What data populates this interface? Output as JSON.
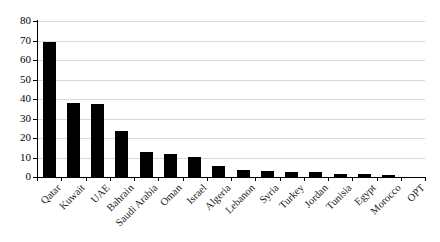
{
  "chart_data": {
    "type": "bar",
    "title": "",
    "subtitle": "",
    "xlabel": "",
    "ylabel": "",
    "ylim": [
      0,
      80
    ],
    "ytick_step": 10,
    "yticks": [
      0,
      10,
      20,
      30,
      40,
      50,
      60,
      70,
      80
    ],
    "ytick_labels": [
      "0",
      "10",
      "20",
      "30",
      "40",
      "50",
      "60",
      "70",
      "80"
    ],
    "grid": true,
    "grid_axis": "y",
    "legend": false,
    "legend_position": "none",
    "bar_color": "#000000",
    "grid_color": "#d8d8d8",
    "axis_color": "#000000",
    "background_color": "#ffffff",
    "categories": [
      "Qatar",
      "Kuwait",
      "UAE",
      "Bahrain",
      "Saudi Arabia",
      "Oman",
      "Israel",
      "Algeria",
      "Lebanon",
      "Syria",
      "Turkey",
      "Jordan",
      "Tunisia",
      "Egypt",
      "Morocco",
      "OPT"
    ],
    "values": [
      69,
      38,
      37.5,
      23.5,
      13,
      12,
      10.5,
      5.5,
      3.7,
      3.1,
      2.6,
      2.4,
      1.8,
      1.7,
      0.8,
      0
    ],
    "series": [
      {
        "name": "",
        "values": [
          69,
          38,
          37.5,
          23.5,
          13,
          12,
          10.5,
          5.5,
          3.7,
          3.1,
          2.6,
          2.4,
          1.8,
          1.7,
          0.8,
          0
        ]
      }
    ],
    "annotations": []
  }
}
